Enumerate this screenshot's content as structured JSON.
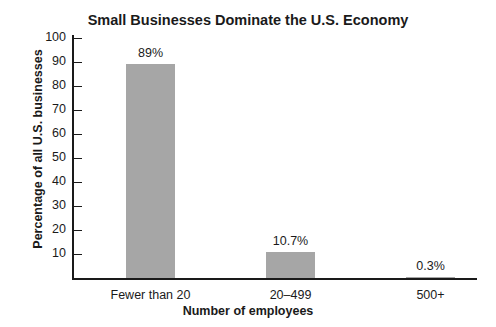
{
  "chart_data": {
    "type": "bar",
    "title": "Small Businesses Dominate the U.S. Economy",
    "xlabel": "Number of employees",
    "ylabel": "Percentage of all U.S. businesses",
    "categories": [
      "Fewer than 20",
      "20–499",
      "500+"
    ],
    "values": [
      89,
      10.7,
      0.3
    ],
    "data_labels": [
      "89%",
      "10.7%",
      "0.3%"
    ],
    "ylim": [
      0,
      100
    ],
    "yticks": [
      10,
      20,
      30,
      40,
      50,
      60,
      70,
      80,
      90,
      100
    ],
    "grid": false,
    "legend": null,
    "bar_color": "#a6a6a6"
  }
}
